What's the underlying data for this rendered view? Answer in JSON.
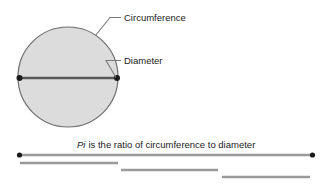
{
  "diagram": {
    "title_caption": "is the ratio of circumference to diameter",
    "caption_italic_word": "Pi",
    "labels": {
      "circumference": "Circumference",
      "diameter": "Diameter"
    },
    "colors": {
      "circle_fill": "#dcdcdc",
      "circle_stroke": "#6e6e6e",
      "diameter_line": "#5a5a5a",
      "measure_line": "#9a9a9a",
      "endpoint_dot": "#1b1b1b",
      "leader_line": "#7a7a7a",
      "text": "#1b1b1b",
      "background": "#ffffff"
    },
    "circle": {
      "center_x": 68,
      "center_y": 77,
      "radius": 50
    },
    "measures": {
      "circumference_bar": {
        "x1": 19,
        "x2": 313,
        "y": 155
      },
      "diameter_bars": [
        {
          "x1": 20,
          "x2": 118,
          "y": 163
        },
        {
          "x1": 121,
          "x2": 218,
          "y": 170
        },
        {
          "x1": 222,
          "x2": 310,
          "y": 177
        }
      ]
    }
  }
}
